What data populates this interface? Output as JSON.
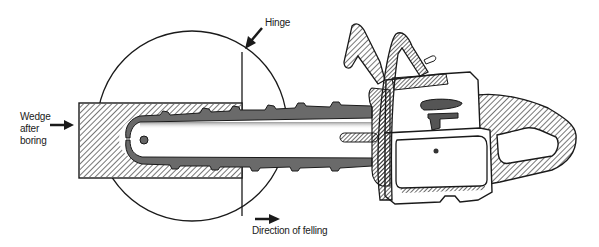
{
  "diagram": {
    "labels": {
      "wedge": [
        "Wedge",
        "after",
        "boring"
      ],
      "hinge": "Hinge",
      "direction": "Direction of felling"
    },
    "icons": {
      "wedge_arrow": "arrow-right-icon",
      "hinge_arrow": "arrow-down-left-icon",
      "direction_arrow": "arrow-right-icon"
    },
    "colors": {
      "ink": "#1a1a1a",
      "background": "#ffffff"
    }
  }
}
